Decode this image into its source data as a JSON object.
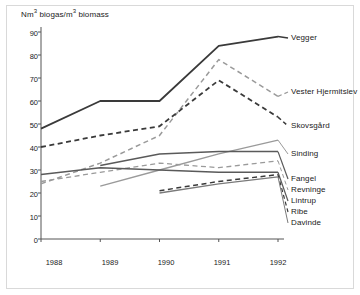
{
  "chart_data": {
    "type": "line",
    "xlabel": "",
    "ylabel": "Nm³ biogas/m³ biomass",
    "x": [
      "1988",
      "1989",
      "1990",
      "1991",
      "1992"
    ],
    "xlim": [
      "1988",
      "1992"
    ],
    "ylim": [
      0,
      90
    ],
    "yticks": [
      0,
      10,
      20,
      30,
      40,
      50,
      60,
      70,
      80,
      90
    ],
    "grid": false,
    "legend_position": "right",
    "series": [
      {
        "name": "Vegger",
        "style": "solid",
        "color": "#3a3a3a",
        "width": 1.8,
        "x": [
          "1988",
          "1989",
          "1990",
          "1991",
          "1992"
        ],
        "values": [
          48,
          60,
          60,
          84,
          88
        ]
      },
      {
        "name": "Vester Hjermitslev",
        "style": "dashed",
        "color": "#9a9a9a",
        "width": 1.5,
        "x": [
          "1988",
          "1989",
          "1990",
          "1991",
          "1992"
        ],
        "values": [
          24,
          33,
          45,
          78,
          62
        ]
      },
      {
        "name": "Skovsgård",
        "style": "dashed",
        "color": "#3a3a3a",
        "width": 1.8,
        "x": [
          "1988",
          "1989",
          "1990",
          "1991",
          "1992"
        ],
        "values": [
          40,
          45,
          49,
          69,
          53
        ]
      },
      {
        "name": "Sinding",
        "style": "solid",
        "color": "#9a9a9a",
        "width": 1.3,
        "x": [
          "1989",
          "1990",
          "1991",
          "1992"
        ],
        "values": [
          23,
          30,
          37,
          43
        ]
      },
      {
        "name": "Fangel",
        "style": "solid",
        "color": "#5a5a5a",
        "width": 1.5,
        "x": [
          "1989",
          "1990",
          "1991",
          "1992"
        ],
        "values": [
          32,
          37,
          38,
          38
        ]
      },
      {
        "name": "Revninge",
        "style": "dashed",
        "color": "#9a9a9a",
        "width": 1.3,
        "x": [
          "1988",
          "1989",
          "1990",
          "1991",
          "1992"
        ],
        "values": [
          25,
          29,
          33,
          31,
          34
        ]
      },
      {
        "name": "Lintrup",
        "style": "solid",
        "color": "#5a5a5a",
        "width": 1.5,
        "x": [
          "1988",
          "1989",
          "1990",
          "1991",
          "1992"
        ],
        "values": [
          28,
          31,
          30,
          29,
          29
        ]
      },
      {
        "name": "Ribe",
        "style": "dashed",
        "color": "#3a3a3a",
        "width": 1.5,
        "x": [
          "1990",
          "1991",
          "1992"
        ],
        "values": [
          21,
          25,
          28
        ]
      },
      {
        "name": "Davinde",
        "style": "solid",
        "color": "#7a7a7a",
        "width": 1.3,
        "x": [
          "1990",
          "1991",
          "1992"
        ],
        "values": [
          20,
          24,
          27
        ]
      }
    ],
    "legend_entries": [
      {
        "label": "Vegger",
        "y": 38
      },
      {
        "label": "Vester Hjermitslev",
        "y": 92
      },
      {
        "label": "Skovsgård",
        "y": 126
      },
      {
        "label": "Sinding",
        "y": 154
      },
      {
        "label": "Fangel",
        "y": 179
      },
      {
        "label": "Revninge",
        "y": 190
      },
      {
        "label": "Lintrup",
        "y": 201
      },
      {
        "label": "Ribe",
        "y": 212
      },
      {
        "label": "Davinde",
        "y": 223
      }
    ]
  },
  "axes": {
    "title": "Nm biogas/m biomass",
    "title_prefix": "Nm",
    "title_mid": " biogas/m",
    "title_suffix": " biomass",
    "sup": "3",
    "y_tick_labels": [
      "90",
      "80",
      "70",
      "60",
      "50",
      "40",
      "30",
      "20",
      "10",
      "0"
    ],
    "x_tick_labels": [
      "1988",
      "1989",
      "1990",
      "1991",
      "1992"
    ]
  },
  "colors": {
    "frame": "#d9d9d9",
    "axis": "#555555",
    "text": "#1a1a1a",
    "dark_line": "#3a3a3a",
    "mid_line": "#5a5a5a",
    "light_line": "#9a9a9a"
  }
}
